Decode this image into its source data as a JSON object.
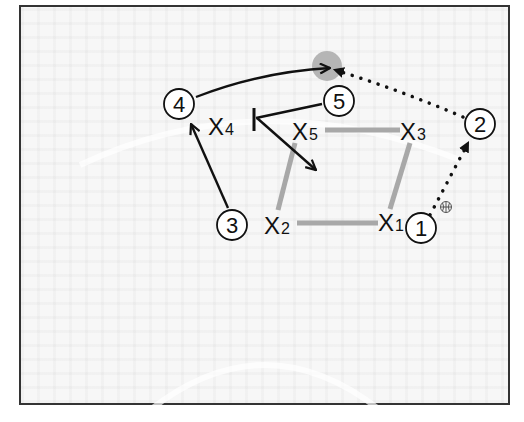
{
  "diagram": {
    "type": "basketball-play",
    "colors": {
      "frame": "#333333",
      "background": "#f7f7f7",
      "line": "#111111",
      "defense_connector": "#a8a8a8",
      "target_spot": "#b5b5b5"
    },
    "offense": [
      {
        "id": "1",
        "label": "1",
        "x": 421,
        "y": 228,
        "has_ball": true
      },
      {
        "id": "2",
        "label": "2",
        "x": 480,
        "y": 124
      },
      {
        "id": "3",
        "label": "3",
        "x": 232,
        "y": 225
      },
      {
        "id": "4",
        "label": "4",
        "x": 179,
        "y": 104
      },
      {
        "id": "5",
        "label": "5",
        "x": 339,
        "y": 101
      }
    ],
    "defense": [
      {
        "id": "X1",
        "label": "X",
        "sub": "1",
        "x": 395,
        "y": 222
      },
      {
        "id": "X2",
        "label": "X",
        "sub": "2",
        "x": 281,
        "y": 225
      },
      {
        "id": "X3",
        "label": "X",
        "sub": "3",
        "x": 412,
        "y": 131
      },
      {
        "id": "X4",
        "label": "X",
        "sub": "4",
        "x": 224,
        "y": 127
      },
      {
        "id": "X5",
        "label": "X",
        "sub": "5",
        "x": 308,
        "y": 131
      }
    ],
    "actions": [
      {
        "type": "pass",
        "from": "1",
        "to": "2",
        "style": "dotted"
      },
      {
        "type": "pass",
        "from": "2",
        "to": "target",
        "style": "dotted"
      },
      {
        "type": "cut",
        "from": "4",
        "to": "target",
        "style": "solid-arrow"
      },
      {
        "type": "cut",
        "from": "3",
        "to": "4",
        "style": "solid-arrow"
      },
      {
        "type": "screen",
        "from": "5",
        "to": "X4-screen",
        "style": "solid-bar"
      },
      {
        "type": "roll",
        "from": "X4-screen",
        "to": "paint",
        "style": "solid-arrow"
      }
    ],
    "ball_icon": "basketball-icon"
  }
}
